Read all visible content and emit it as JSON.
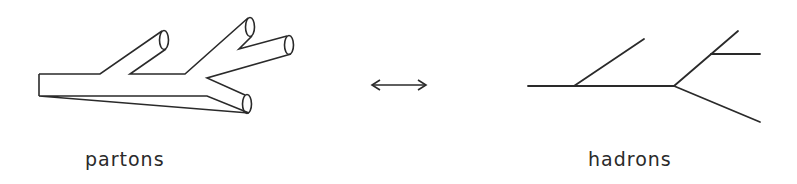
{
  "diagram": {
    "type": "parton-to-hadron-correspondence",
    "left_label": "partons",
    "right_label": "hadrons",
    "arrow": "double-headed",
    "stroke_color": "#2a2a2a",
    "background": "#ffffff"
  },
  "partons": {
    "style": "tube",
    "branches": 4
  },
  "hadrons": {
    "style": "line",
    "branches": 4
  }
}
